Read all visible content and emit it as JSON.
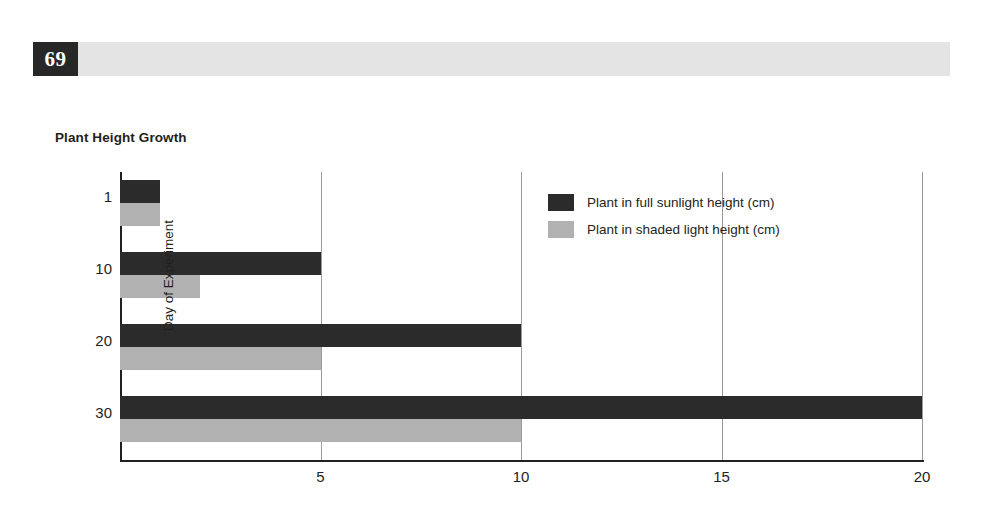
{
  "header": {
    "page_number": "69",
    "band_color": "#e4e4e4",
    "number_box_color": "#272727"
  },
  "chart_data": {
    "type": "bar",
    "orientation": "horizontal",
    "title": "Plant Height Growth",
    "xlabel": "",
    "ylabel": "Day of Experiment",
    "categories": [
      "1",
      "10",
      "20",
      "30"
    ],
    "series": [
      {
        "name": "Plant in full sunlight height (cm)",
        "color": "#2b2b2b",
        "values": [
          1,
          5,
          10,
          20
        ]
      },
      {
        "name": "Plant in shaded light height (cm)",
        "color": "#b1b1b1",
        "values": [
          1,
          2,
          5,
          10
        ]
      }
    ],
    "xlim": [
      0,
      20
    ],
    "xticks": [
      "5",
      "10",
      "15",
      "20"
    ],
    "xtick_values": [
      5,
      10,
      15,
      20
    ],
    "yticks": [
      "1",
      "10",
      "20",
      "30"
    ],
    "grid": true,
    "legend_position": "inside-upper-right"
  }
}
